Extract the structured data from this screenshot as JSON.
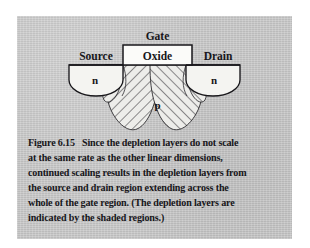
{
  "figure": {
    "number_label": "Figure 6.15",
    "caption_text": "Since the depletion layers do not scale at the same rate as the other linear dimensions, continued scaling results in the depletion layers from the source and drain region extending across the whole of the gate region. (The depletion layers are indicated by the shaded regions.)",
    "caption_lines": [
      "Since the depletion layers do not scale",
      "at the same rate as the other linear dimensions,",
      "continued scaling results in the depletion layers from",
      "the source and drain region extending across the",
      "whole of the gate region. (The depletion layers are",
      "indicated by the shaded regions.)"
    ]
  },
  "diagram": {
    "labels": {
      "gate": "Gate",
      "oxide": "Oxide",
      "source": "Source",
      "drain": "Drain",
      "n_left": "n",
      "n_right": "n",
      "p_substrate": "p"
    }
  },
  "colors": {
    "page_background": "#ffffff",
    "panel_background": "#c7c7c7",
    "ink": "#17161a",
    "region_fill": "#f2f2ef",
    "hatch_fill": "#e8e8e4",
    "hatch_line": "#2b2a2e"
  }
}
